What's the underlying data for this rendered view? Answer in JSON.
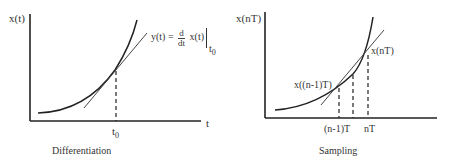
{
  "panels": [
    {
      "id": "differentiation",
      "caption": "Differentiation",
      "y_axis_label": "x(t)",
      "x_axis_label": "t",
      "tick_label": {
        "base": "t",
        "sub": "0"
      },
      "annotation": {
        "lhs": "y(t) =",
        "frac_num": "d",
        "frac_den": "dt",
        "rhs": "x(t)",
        "eval_sub": "t",
        "eval_sub_index": "0"
      }
    },
    {
      "id": "sampling",
      "caption": "Sampling",
      "y_axis_label": "x(nT)",
      "tick_labels": [
        "(n-1)T",
        "nT"
      ],
      "point_labels": [
        "x((n-1)T)",
        "x(nT)"
      ]
    }
  ],
  "colors": {
    "line": "#2a2a2a",
    "background": "#ffffff"
  }
}
